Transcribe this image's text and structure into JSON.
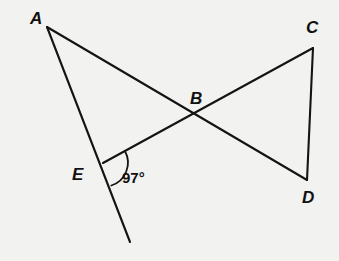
{
  "figure": {
    "background_color": "#f2f2f0",
    "stroke_color": "#141414",
    "points": {
      "A": {
        "label": "A",
        "x": 47,
        "y": 27,
        "label_x": 30,
        "label_y": 24
      },
      "B": {
        "label": "B",
        "x": 195,
        "y": 115,
        "label_x": 190,
        "label_y": 104
      },
      "C": {
        "label": "C",
        "x": 313,
        "y": 48,
        "label_x": 306,
        "label_y": 33
      },
      "D": {
        "label": "D",
        "x": 307,
        "y": 180,
        "label_x": 302,
        "label_y": 203
      },
      "E": {
        "label": "E",
        "x": 103,
        "y": 163,
        "label_x": 72,
        "label_y": 180
      },
      "F": {
        "label": "",
        "x": 130,
        "y": 242,
        "label_x": 0,
        "label_y": 0
      }
    },
    "segments": [
      {
        "name": "segment-A-D",
        "from": "A",
        "to": "D"
      },
      {
        "name": "segment-A-F",
        "from": "A",
        "to": "F"
      },
      {
        "name": "segment-E-C",
        "from": "E",
        "to": "C"
      },
      {
        "name": "segment-C-D",
        "from": "C",
        "to": "D"
      }
    ],
    "angle_marks": [
      {
        "name": "angle-at-E",
        "value": "97°",
        "vertex": "E",
        "label_x": 122,
        "label_y": 183,
        "arc_radius": 24
      }
    ]
  }
}
